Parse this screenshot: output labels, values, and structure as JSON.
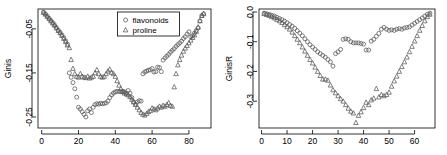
{
  "figure": {
    "panel_count": 2,
    "background": "#ffffff",
    "marker_color": "#555555"
  },
  "chart_data": [
    {
      "type": "scatter",
      "title": "",
      "xlabel": "",
      "ylabel": "Ginis",
      "xlim": [
        -2,
        92
      ],
      "ylim": [
        -0.275,
        -0.005
      ],
      "xticks": [
        0,
        20,
        40,
        60,
        80
      ],
      "yticks": [
        -0.05,
        -0.15,
        -0.25
      ],
      "ytick_labels": [
        "-0.05",
        "-0.15",
        "-0.25"
      ],
      "xtick_labels": [
        "0",
        "20",
        "40",
        "60",
        "80"
      ],
      "grid": false,
      "legend": {
        "position": "top-center",
        "entries": [
          {
            "label": "flavonoids",
            "marker": "circle"
          },
          {
            "label": "proline",
            "marker": "triangle"
          }
        ]
      },
      "series": [
        {
          "name": "flavonoids",
          "marker": "circle",
          "x": [
            1,
            2,
            3,
            4,
            5,
            6,
            7,
            8,
            9,
            10,
            11,
            12,
            13,
            14,
            15,
            16,
            17,
            18,
            19,
            20,
            21,
            22,
            23,
            24,
            25,
            26,
            27,
            28,
            29,
            30,
            31,
            32,
            33,
            34,
            35,
            36,
            37,
            38,
            39,
            40,
            41,
            42,
            43,
            44,
            45,
            46,
            47,
            48,
            49,
            50,
            51,
            52,
            53,
            54,
            55,
            56,
            57,
            58,
            59,
            60,
            61,
            62,
            63,
            64,
            65,
            66,
            67,
            68,
            69,
            70,
            71,
            72,
            73,
            74,
            75,
            76,
            77,
            78,
            79,
            80,
            81,
            82,
            83,
            84,
            85,
            86,
            87,
            88
          ],
          "y": [
            -0.012,
            -0.016,
            -0.021,
            -0.026,
            -0.031,
            -0.036,
            -0.041,
            -0.047,
            -0.053,
            -0.058,
            -0.064,
            -0.07,
            -0.077,
            -0.085,
            -0.15,
            -0.16,
            -0.172,
            -0.186,
            -0.205,
            -0.228,
            -0.232,
            -0.238,
            -0.244,
            -0.25,
            -0.236,
            -0.232,
            -0.24,
            -0.228,
            -0.222,
            -0.22,
            -0.221,
            -0.219,
            -0.22,
            -0.219,
            -0.218,
            -0.214,
            -0.206,
            -0.2,
            -0.196,
            -0.193,
            -0.192,
            -0.192,
            -0.193,
            -0.192,
            -0.193,
            -0.196,
            -0.19,
            -0.196,
            -0.206,
            -0.216,
            -0.221,
            -0.216,
            -0.213,
            -0.214,
            -0.152,
            -0.148,
            -0.146,
            -0.144,
            -0.143,
            -0.14,
            -0.148,
            -0.147,
            -0.137,
            -0.138,
            -0.147,
            -0.121,
            -0.116,
            -0.112,
            -0.108,
            -0.103,
            -0.099,
            -0.095,
            -0.09,
            -0.086,
            -0.082,
            -0.078,
            -0.072,
            -0.068,
            -0.062,
            -0.057,
            -0.068,
            -0.066,
            -0.06,
            -0.054,
            -0.048,
            -0.032,
            -0.02,
            -0.016
          ]
        },
        {
          "name": "proline",
          "marker": "triangle",
          "x": [
            1,
            2,
            3,
            4,
            5,
            6,
            7,
            8,
            9,
            10,
            11,
            12,
            13,
            14,
            15,
            16,
            17,
            18,
            19,
            20,
            21,
            22,
            23,
            24,
            25,
            26,
            27,
            28,
            29,
            30,
            31,
            32,
            33,
            34,
            35,
            36,
            37,
            38,
            39,
            40,
            41,
            42,
            43,
            44,
            45,
            46,
            47,
            48,
            49,
            50,
            51,
            52,
            53,
            54,
            55,
            56,
            57,
            58,
            59,
            60,
            61,
            62,
            63,
            64,
            65,
            66,
            67,
            68,
            69,
            70,
            71,
            72,
            73,
            74,
            75,
            76,
            77,
            78,
            79,
            80,
            81,
            82,
            83,
            84,
            85,
            86,
            87,
            88
          ],
          "y": [
            -0.013,
            -0.017,
            -0.022,
            -0.027,
            -0.032,
            -0.037,
            -0.042,
            -0.048,
            -0.054,
            -0.059,
            -0.065,
            -0.072,
            -0.079,
            -0.087,
            -0.093,
            -0.12,
            -0.14,
            -0.152,
            -0.158,
            -0.16,
            -0.152,
            -0.158,
            -0.16,
            -0.161,
            -0.158,
            -0.162,
            -0.16,
            -0.158,
            -0.15,
            -0.143,
            -0.152,
            -0.158,
            -0.16,
            -0.158,
            -0.152,
            -0.146,
            -0.142,
            -0.149,
            -0.152,
            -0.158,
            -0.168,
            -0.178,
            -0.186,
            -0.192,
            -0.196,
            -0.198,
            -0.2,
            -0.204,
            -0.21,
            -0.216,
            -0.222,
            -0.228,
            -0.234,
            -0.24,
            -0.244,
            -0.246,
            -0.242,
            -0.238,
            -0.236,
            -0.23,
            -0.232,
            -0.234,
            -0.23,
            -0.226,
            -0.228,
            -0.224,
            -0.226,
            -0.222,
            -0.218,
            -0.224,
            -0.226,
            -0.182,
            -0.152,
            -0.132,
            -0.12,
            -0.11,
            -0.101,
            -0.094,
            -0.088,
            -0.082,
            -0.076,
            -0.07,
            -0.064,
            -0.056,
            -0.046,
            -0.032,
            -0.02,
            -0.016
          ]
        }
      ]
    },
    {
      "type": "scatter",
      "title": "",
      "xlabel": "",
      "ylabel": "GinisR",
      "xlim": [
        -1,
        68
      ],
      "ylim": [
        -0.39,
        0.01
      ],
      "xticks": [
        0,
        10,
        20,
        30,
        40,
        50,
        60
      ],
      "yticks": [
        0.0,
        -0.1,
        -0.2,
        -0.3
      ],
      "ytick_labels": [
        "0.0",
        "-0.1",
        "-0.2",
        "-0.3"
      ],
      "xtick_labels": [
        "0",
        "10",
        "20",
        "30",
        "40",
        "50",
        "60"
      ],
      "grid": false,
      "legend": null,
      "series": [
        {
          "name": "flavonoids",
          "marker": "circle",
          "x": [
            1,
            2,
            3,
            4,
            5,
            6,
            7,
            8,
            9,
            10,
            11,
            12,
            13,
            14,
            15,
            16,
            17,
            18,
            19,
            20,
            21,
            22,
            23,
            24,
            25,
            26,
            27,
            28,
            29,
            30,
            31,
            32,
            33,
            34,
            35,
            36,
            37,
            38,
            39,
            40,
            41,
            42,
            43,
            44,
            45,
            46,
            47,
            48,
            49,
            50,
            51,
            52,
            53,
            54,
            55,
            56,
            57,
            58,
            59,
            60,
            61,
            62,
            63,
            64,
            65,
            66
          ],
          "y": [
            -0.004,
            -0.006,
            -0.008,
            -0.011,
            -0.014,
            -0.018,
            -0.022,
            -0.026,
            -0.031,
            -0.036,
            -0.042,
            -0.048,
            -0.055,
            -0.063,
            -0.071,
            -0.08,
            -0.09,
            -0.1,
            -0.11,
            -0.118,
            -0.126,
            -0.134,
            -0.14,
            -0.146,
            -0.152,
            -0.16,
            -0.168,
            -0.182,
            -0.14,
            -0.134,
            -0.126,
            -0.092,
            -0.09,
            -0.092,
            -0.1,
            -0.104,
            -0.104,
            -0.104,
            -0.106,
            -0.108,
            -0.128,
            -0.128,
            -0.098,
            -0.092,
            -0.082,
            -0.072,
            -0.058,
            -0.052,
            -0.058,
            -0.062,
            -0.06,
            -0.062,
            -0.058,
            -0.056,
            -0.058,
            -0.054,
            -0.052,
            -0.05,
            -0.044,
            -0.038,
            -0.032,
            -0.026,
            -0.02,
            -0.014,
            -0.008,
            -0.004
          ]
        },
        {
          "name": "proline",
          "marker": "triangle",
          "x": [
            1,
            2,
            3,
            4,
            5,
            6,
            7,
            8,
            9,
            10,
            11,
            12,
            13,
            14,
            15,
            16,
            17,
            18,
            19,
            20,
            21,
            22,
            23,
            24,
            25,
            26,
            27,
            28,
            29,
            30,
            31,
            32,
            33,
            34,
            35,
            36,
            37,
            38,
            39,
            40,
            41,
            42,
            43,
            44,
            45,
            46,
            47,
            48,
            49,
            50,
            51,
            52,
            53,
            54,
            55,
            56,
            57,
            58,
            59,
            60,
            61,
            62,
            63,
            64,
            65,
            66
          ],
          "y": [
            -0.006,
            -0.009,
            -0.012,
            -0.016,
            -0.02,
            -0.025,
            -0.03,
            -0.036,
            -0.043,
            -0.05,
            -0.058,
            -0.068,
            -0.08,
            -0.092,
            -0.104,
            -0.118,
            -0.132,
            -0.146,
            -0.16,
            -0.172,
            -0.186,
            -0.2,
            -0.214,
            -0.226,
            -0.226,
            -0.23,
            -0.246,
            -0.262,
            -0.272,
            -0.282,
            -0.292,
            -0.3,
            -0.312,
            -0.324,
            -0.334,
            -0.34,
            -0.372,
            -0.348,
            -0.336,
            -0.322,
            -0.304,
            -0.312,
            -0.296,
            -0.29,
            -0.258,
            -0.286,
            -0.278,
            -0.282,
            -0.278,
            -0.27,
            -0.25,
            -0.232,
            -0.216,
            -0.2,
            -0.184,
            -0.168,
            -0.152,
            -0.134,
            -0.116,
            -0.098,
            -0.08,
            -0.062,
            -0.046,
            -0.03,
            -0.016,
            -0.008
          ]
        }
      ]
    }
  ]
}
